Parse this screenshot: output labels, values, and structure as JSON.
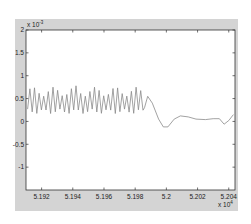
{
  "chart_data": {
    "type": "line",
    "title": "",
    "xlabel": "",
    "ylabel": "",
    "x_multiplier": "x 10^4",
    "y_multiplier": "x 10^-3",
    "xlim": [
      5.191,
      5.2044
    ],
    "ylim": [
      -1.5,
      2
    ],
    "x_ticks": [
      "5.192",
      "5.194",
      "5.196",
      "5.198",
      "5.2",
      "5.202",
      "5.204"
    ],
    "y_ticks": [
      "2",
      "1.5",
      "1",
      "0.5",
      "0",
      "-0.5",
      "-1"
    ],
    "grid": false,
    "series": [
      {
        "name": "signal",
        "description": "Oscillation ~0.2–0.75 (x10^-3) with ~25 cycles from 5.191 to 5.1985, then a damped slow wave: peak ~0.55 at 5.1988, trough ~-0.15 at 5.2, ~0.1 at 5.201, ~0.05 at 5.203, dip ~-0.05 at 5.2037, rising to ~0.15 at 5.2043",
        "color": "#808080"
      }
    ]
  },
  "axes": {
    "x_exp_label": "x 10",
    "x_exp": "4",
    "y_exp_label": "x 10",
    "y_exp": "-3"
  }
}
